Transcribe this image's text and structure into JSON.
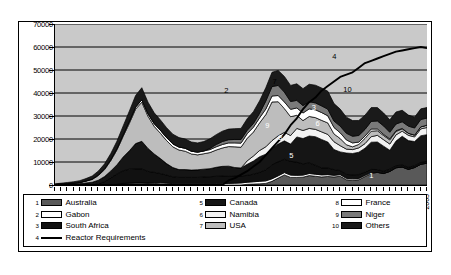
{
  "chart_data": {
    "type": "area",
    "title": "",
    "xlabel": "",
    "ylabel": "",
    "ylim": [
      0,
      70000
    ],
    "ytick_labels": [
      "0",
      "10000",
      "20000",
      "30000",
      "40000",
      "50000",
      "60000",
      "70000"
    ],
    "ytick_values": [
      0,
      10000,
      20000,
      30000,
      40000,
      50000,
      60000,
      70000
    ],
    "grid": true,
    "legend_position": "bottom",
    "x": [
      1945,
      1946,
      1947,
      1948,
      1949,
      1950,
      1951,
      1952,
      1953,
      1954,
      1955,
      1956,
      1957,
      1958,
      1959,
      1960,
      1961,
      1962,
      1963,
      1964,
      1965,
      1966,
      1967,
      1968,
      1969,
      1970,
      1971,
      1972,
      1973,
      1974,
      1975,
      1976,
      1977,
      1978,
      1979,
      1980,
      1981,
      1982,
      1983,
      1984,
      1985,
      1986,
      1987,
      1988,
      1989,
      1990,
      1991,
      1992,
      1993,
      1994,
      1995,
      1996,
      1997,
      1998,
      1999,
      2000,
      2001,
      2002,
      2003,
      2004,
      2005
    ],
    "xtick_labels": [
      "1945",
      "1948",
      "1951",
      "1954",
      "1957",
      "1960",
      "1963",
      "1966",
      "1969",
      "1972",
      "1975",
      "1978",
      "1981",
      "1984",
      "1987",
      "1990",
      "1993",
      "1996",
      "1999",
      "2002",
      "2005"
    ],
    "stacked_series": [
      {
        "name": "Australia",
        "legend_index": 1,
        "color": "#595959",
        "values": [
          0,
          0,
          0,
          0,
          0,
          0,
          0,
          0,
          0,
          100,
          300,
          700,
          900,
          1000,
          1000,
          900,
          700,
          500,
          300,
          100,
          0,
          0,
          0,
          0,
          0,
          0,
          0,
          0,
          0,
          0,
          0,
          300,
          400,
          500,
          700,
          1600,
          3000,
          4400,
          3300,
          3300,
          3400,
          4100,
          3800,
          3500,
          3700,
          3500,
          3800,
          2300,
          2100,
          2300,
          3700,
          5000,
          5500,
          5000,
          5900,
          7500,
          7800,
          6800,
          7600,
          9000,
          9500
        ]
      },
      {
        "name": "Gabon",
        "legend_index": 2,
        "color": "#ffffff",
        "values": [
          0,
          0,
          0,
          0,
          0,
          0,
          0,
          0,
          0,
          0,
          0,
          0,
          0,
          0,
          0,
          0,
          300,
          500,
          500,
          500,
          500,
          500,
          500,
          500,
          600,
          600,
          600,
          600,
          700,
          800,
          900,
          900,
          1000,
          1100,
          1100,
          1100,
          1000,
          1000,
          1000,
          900,
          900,
          900,
          900,
          900,
          800,
          700,
          700,
          600,
          600,
          550,
          500,
          400,
          0,
          0,
          0,
          0,
          0,
          0,
          0,
          0,
          0
        ]
      },
      {
        "name": "South Africa",
        "legend_index": 3,
        "color": "#111111",
        "values": [
          0,
          0,
          0,
          0,
          0,
          0,
          0,
          500,
          1500,
          3000,
          4500,
          5500,
          6000,
          6000,
          6000,
          5000,
          4500,
          4000,
          3500,
          3000,
          2800,
          2800,
          2800,
          2800,
          2900,
          3000,
          3200,
          3300,
          3300,
          3100,
          3000,
          3000,
          3300,
          3900,
          4800,
          6100,
          6100,
          5800,
          6000,
          5700,
          4900,
          4600,
          3900,
          3000,
          2900,
          2500,
          1800,
          1700,
          1700,
          1700,
          1400,
          1400,
          1200,
          1000,
          1000,
          900,
          900,
          900,
          800,
          800,
          800
        ]
      },
      {
        "name": "Canada",
        "legend_index": 5,
        "color": "#151515",
        "values": [
          100,
          200,
          300,
          400,
          600,
          900,
          1200,
          1600,
          2200,
          3000,
          4000,
          6000,
          8000,
          11000,
          12000,
          10000,
          8000,
          6500,
          5000,
          4000,
          3400,
          3400,
          3200,
          3300,
          3400,
          3500,
          3900,
          4200,
          4200,
          3700,
          3500,
          4800,
          5700,
          6800,
          6800,
          7100,
          7700,
          8000,
          7500,
          11000,
          11000,
          11700,
          12400,
          12400,
          11300,
          8700,
          8100,
          9300,
          9300,
          9700,
          10400,
          11800,
          12000,
          10900,
          8200,
          10700,
          12500,
          11600,
          10500,
          11600,
          11600
        ]
      },
      {
        "name": "Namibia",
        "legend_index": 6,
        "color": "#f2f2f2",
        "values": [
          0,
          0,
          0,
          0,
          0,
          0,
          0,
          0,
          0,
          0,
          0,
          0,
          0,
          0,
          0,
          0,
          0,
          0,
          0,
          0,
          0,
          0,
          0,
          0,
          0,
          0,
          0,
          0,
          0,
          0,
          0,
          1500,
          2200,
          2700,
          3200,
          3400,
          3600,
          3700,
          3700,
          3700,
          3500,
          3300,
          3200,
          3300,
          3300,
          3400,
          2700,
          1700,
          1700,
          1900,
          2000,
          2400,
          2900,
          2800,
          2700,
          2700,
          2200,
          2300,
          2000,
          3000,
          3100
        ]
      },
      {
        "name": "USA",
        "legend_index": 7,
        "color": "#bdbdbd",
        "values": [
          100,
          200,
          300,
          400,
          500,
          800,
          1200,
          2000,
          3000,
          4500,
          6500,
          9000,
          12000,
          15000,
          17000,
          14000,
          12000,
          11000,
          10000,
          9000,
          8500,
          8000,
          7000,
          6500,
          6700,
          7000,
          7500,
          8000,
          8500,
          9000,
          9000,
          9800,
          10400,
          12000,
          14000,
          16800,
          14800,
          10300,
          8200,
          5700,
          4300,
          5200,
          5100,
          5000,
          5000,
          3400,
          3100,
          1900,
          1200,
          1500,
          2300,
          2400,
          2000,
          1800,
          1800,
          1500,
          1000,
          900,
          800,
          900,
          1000
        ]
      },
      {
        "name": "France",
        "legend_index": 8,
        "color": "#ffffff",
        "values": [
          0,
          0,
          0,
          0,
          0,
          100,
          200,
          300,
          400,
          500,
          600,
          700,
          800,
          900,
          1000,
          1100,
          1200,
          1300,
          1300,
          1300,
          1300,
          1300,
          1200,
          1200,
          1200,
          1300,
          1400,
          1500,
          1600,
          1700,
          1800,
          2000,
          2100,
          2200,
          2400,
          2600,
          2700,
          2900,
          3200,
          3200,
          3300,
          3300,
          3400,
          3400,
          3100,
          2800,
          2500,
          2100,
          1700,
          1000,
          980,
          950,
          750,
          500,
          450,
          320,
          200,
          0,
          0,
          0,
          0
        ]
      },
      {
        "name": "Niger",
        "legend_index": 9,
        "color": "#7a7a7a",
        "values": [
          0,
          0,
          0,
          0,
          0,
          0,
          0,
          0,
          0,
          0,
          0,
          0,
          0,
          0,
          0,
          0,
          0,
          0,
          0,
          0,
          0,
          0,
          0,
          0,
          0,
          500,
          1000,
          1300,
          1400,
          1500,
          1600,
          1500,
          1600,
          2000,
          3500,
          4100,
          4400,
          4300,
          3400,
          3300,
          3200,
          3100,
          3000,
          2900,
          2900,
          2800,
          2900,
          2900,
          2900,
          2900,
          2900,
          3300,
          3500,
          3700,
          2900,
          2900,
          2900,
          3100,
          3100,
          3200,
          3100
        ]
      },
      {
        "name": "Others",
        "legend_index": 10,
        "color": "#1a1a1a",
        "values": [
          300,
          400,
          500,
          600,
          800,
          1000,
          1300,
          1700,
          2100,
          2600,
          3200,
          3800,
          4500,
          5000,
          5300,
          5000,
          4700,
          4500,
          4300,
          4200,
          4100,
          4000,
          4000,
          4000,
          4100,
          4200,
          4300,
          4500,
          4600,
          4700,
          4800,
          5000,
          5200,
          5400,
          5800,
          6200,
          6500,
          6800,
          7000,
          7200,
          7400,
          7600,
          7700,
          7800,
          7800,
          7600,
          7400,
          7000,
          6800,
          6500,
          6200,
          6000,
          5800,
          5600,
          5400,
          5200,
          5000,
          4800,
          4700,
          4600,
          4600
        ]
      }
    ],
    "line_series": {
      "name": "Reactor Requirements",
      "legend_index": 4,
      "color": "#000000",
      "values": [
        0,
        0,
        0,
        0,
        0,
        0,
        0,
        0,
        0,
        0,
        0,
        0,
        0,
        0,
        0,
        0,
        0,
        0,
        0,
        0,
        0,
        0,
        0,
        0,
        0,
        0,
        0,
        0,
        2000,
        3000,
        4500,
        6000,
        8000,
        10000,
        13000,
        16000,
        19000,
        22000,
        26000,
        29000,
        33000,
        36000,
        38000,
        41000,
        43000,
        45000,
        47000,
        48000,
        49000,
        51000,
        53000,
        54000,
        55000,
        56000,
        57000,
        58000,
        58500,
        59000,
        59500,
        60000,
        59500
      ]
    },
    "callouts": [
      {
        "label": "2",
        "x_pct": 45.5,
        "y_pct": 38.5
      },
      {
        "label": "7",
        "x_pct": 58.5,
        "y_pct": 33.0
      },
      {
        "label": "4",
        "x_pct": 74.5,
        "y_pct": 17.5
      },
      {
        "label": "10",
        "x_pct": 77.5,
        "y_pct": 38.0
      },
      {
        "label": "3",
        "x_pct": 69.0,
        "y_pct": 49.0
      },
      {
        "label": "9",
        "x_pct": 56.5,
        "y_pct": 60.5
      },
      {
        "label": "6",
        "x_pct": 70.0,
        "y_pct": 59.0
      },
      {
        "label": "8",
        "x_pct": 60.0,
        "y_pct": 68.0
      },
      {
        "label": "5",
        "x_pct": 63.0,
        "y_pct": 79.0
      },
      {
        "label": "1",
        "x_pct": 84.5,
        "y_pct": 91.0
      }
    ]
  },
  "legend": {
    "columns": [
      [
        {
          "num": "1",
          "label": "Australia",
          "swatch": "#595959",
          "type": "box"
        },
        {
          "num": "2",
          "label": "Gabon",
          "swatch": "#ffffff",
          "type": "box"
        },
        {
          "num": "3",
          "label": "South Africa",
          "swatch": "#111111",
          "type": "box"
        },
        {
          "num": "4",
          "label": "Reactor Requirements",
          "swatch": "#000000",
          "type": "line"
        }
      ],
      [
        {
          "num": "5",
          "label": "Canada",
          "swatch": "#151515",
          "type": "box"
        },
        {
          "num": "6",
          "label": "Namibia",
          "swatch": "#f2f2f2",
          "type": "box"
        },
        {
          "num": "7",
          "label": "USA",
          "swatch": "#bdbdbd",
          "type": "box"
        }
      ],
      [
        {
          "num": "8",
          "label": "France",
          "swatch": "#ffffff",
          "type": "box"
        },
        {
          "num": "9",
          "label": "Niger",
          "swatch": "#7a7a7a",
          "type": "box"
        },
        {
          "num": "10",
          "label": "Others",
          "swatch": "#1a1a1a",
          "type": "box"
        }
      ]
    ]
  }
}
